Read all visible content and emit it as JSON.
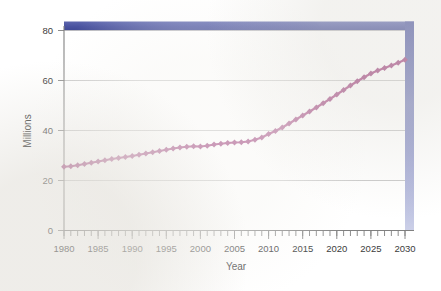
{
  "chart_data": {
    "type": "line",
    "title": "",
    "xlabel": "Year",
    "ylabel": "Millions",
    "xlim": [
      1980,
      2030
    ],
    "ylim": [
      0,
      80
    ],
    "grid": true,
    "legend": false,
    "y_ticks": [
      0,
      20,
      40,
      60,
      80
    ],
    "x_ticks": [
      1980,
      1985,
      1990,
      1995,
      2000,
      2005,
      2010,
      2015,
      2020,
      2025,
      2030
    ],
    "x_minor_tick_interval": 1,
    "series": [
      {
        "name": "Population",
        "color": "#9c3f7c",
        "marker": "diamond",
        "x": [
          1980,
          1981,
          1982,
          1983,
          1984,
          1985,
          1986,
          1987,
          1988,
          1989,
          1990,
          1991,
          1992,
          1993,
          1994,
          1995,
          1996,
          1997,
          1998,
          1999,
          2000,
          2001,
          2002,
          2003,
          2004,
          2005,
          2006,
          2007,
          2008,
          2009,
          2010,
          2011,
          2012,
          2013,
          2014,
          2015,
          2016,
          2017,
          2018,
          2019,
          2020,
          2021,
          2022,
          2023,
          2024,
          2025,
          2026,
          2027,
          2028,
          2029,
          2030
        ],
        "values": [
          25.5,
          25.7,
          26.1,
          26.6,
          27.1,
          27.6,
          28.1,
          28.6,
          29.0,
          29.4,
          29.8,
          30.3,
          30.8,
          31.3,
          31.8,
          32.3,
          32.8,
          33.2,
          33.5,
          33.7,
          33.6,
          33.9,
          34.4,
          34.7,
          35.0,
          35.2,
          35.3,
          35.6,
          36.3,
          37.2,
          38.6,
          39.8,
          41.2,
          42.8,
          44.4,
          46.0,
          47.6,
          49.2,
          50.9,
          52.6,
          54.4,
          56.2,
          58.0,
          59.7,
          61.3,
          62.8,
          64.0,
          65.0,
          66.0,
          67.1,
          68.3
        ]
      }
    ]
  },
  "axes": {
    "y_label": "Millions",
    "x_label": "Year",
    "y_tick_labels": [
      "0",
      "20",
      "40",
      "60",
      "80"
    ],
    "x_tick_labels": [
      "1980",
      "1985",
      "1990",
      "1995",
      "2000",
      "2005",
      "2010",
      "2015",
      "2020",
      "2025",
      "2030"
    ]
  },
  "decoration": {
    "frame_color_top": "#4a53a0",
    "frame_color_bottom": "#c9cce6",
    "line_color": "#9c3f7c",
    "grid_color": "#b9b9b9",
    "axis_color": "#808080",
    "background": "#ffffff"
  }
}
